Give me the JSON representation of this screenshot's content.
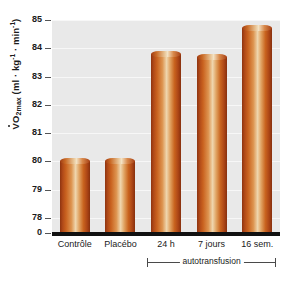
{
  "chart_data": {
    "type": "bar",
    "title": "",
    "subtitle": "",
    "xlabel": "",
    "ylabel": "V̇O2max (ml · kg⁻¹ · min⁻¹)",
    "ylabel_parts": {
      "symbol": "VO",
      "symbol_sub": "2max",
      "units_open": " (ml · kg",
      "unit_sup_1": "-1",
      "units_mid": " · min",
      "unit_sup_2": "-1",
      "units_close": ")"
    },
    "categories": [
      "Contrôle",
      "Placébo",
      "24 h",
      "7 jours",
      "16 sem."
    ],
    "values": [
      80.0,
      80.0,
      83.8,
      83.7,
      84.7
    ],
    "ylim": [
      77.5,
      85
    ],
    "yticks": [
      85,
      84,
      83,
      82,
      81,
      80,
      79,
      78
    ],
    "ytick_labels": [
      "85",
      "84",
      "83",
      "82",
      "81",
      "80",
      "79",
      "78"
    ],
    "axis_origin_label": "0",
    "axis_break": true,
    "grid": true,
    "grid_axis": "y",
    "legend": "none",
    "annotations": [
      {
        "text": "autotransfusion",
        "type": "bracket",
        "covers": [
          "24 h",
          "7 jours",
          "16 sem."
        ]
      }
    ],
    "colors": {
      "bar_edge": "#8e3410",
      "bar_mid": "#c9621f",
      "bar_highlight": "#efd6ae",
      "plot_background": "#e9e9e9",
      "gridline": "#f7f7f7",
      "axis": "#111111",
      "text": "#1a1a1a",
      "figure_background": "#ffffff"
    }
  }
}
